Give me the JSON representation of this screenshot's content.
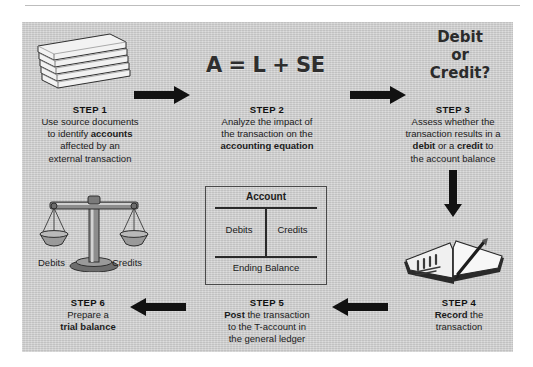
{
  "figure": {
    "panel_color": "#cccccc",
    "ink_color": "#1b1b1b"
  },
  "equation": {
    "text": "A = L + SE",
    "label": "accounting-equation"
  },
  "debit_or_credit": {
    "line1": "Debit",
    "line2": "or",
    "line3": "Credit?"
  },
  "t_account": {
    "header": "Account",
    "left_label": "Debits",
    "right_label": "Credits",
    "footer": "Ending Balance"
  },
  "scales": {
    "left_label": "Debits",
    "right_label": "Credits"
  },
  "steps": [
    {
      "id": "step-1",
      "title": "STEP 1",
      "lines": [
        [
          {
            "t": "Use source documents",
            "b": false
          }
        ],
        [
          {
            "t": "to identify ",
            "b": false
          },
          {
            "t": "accounts",
            "b": true
          }
        ],
        [
          {
            "t": "affected by an",
            "b": false
          }
        ],
        [
          {
            "t": "external transaction",
            "b": false
          }
        ]
      ]
    },
    {
      "id": "step-2",
      "title": "STEP 2",
      "lines": [
        [
          {
            "t": "Analyze the impact of",
            "b": false
          }
        ],
        [
          {
            "t": "the transaction on the",
            "b": false
          }
        ],
        [
          {
            "t": "accounting equation",
            "b": true
          }
        ]
      ]
    },
    {
      "id": "step-3",
      "title": "STEP 3",
      "lines": [
        [
          {
            "t": "Assess whether the",
            "b": false
          }
        ],
        [
          {
            "t": "transaction results in a",
            "b": false
          }
        ],
        [
          {
            "t": "debit",
            "b": true
          },
          {
            "t": " or a ",
            "b": false
          },
          {
            "t": "credit",
            "b": true
          },
          {
            "t": " to",
            "b": false
          }
        ],
        [
          {
            "t": "the account balance",
            "b": false
          }
        ]
      ]
    },
    {
      "id": "step-4",
      "title": "STEP 4",
      "lines": [
        [
          {
            "t": "Record",
            "b": true
          },
          {
            "t": " the",
            "b": false
          }
        ],
        [
          {
            "t": "transaction",
            "b": false
          }
        ]
      ]
    },
    {
      "id": "step-5",
      "title": "STEP 5",
      "lines": [
        [
          {
            "t": "Post",
            "b": true
          },
          {
            "t": " the transaction",
            "b": false
          }
        ],
        [
          {
            "t": "to the T-account in",
            "b": false
          }
        ],
        [
          {
            "t": "the general ledger",
            "b": false
          }
        ]
      ]
    },
    {
      "id": "step-6",
      "title": "STEP 6",
      "lines": [
        [
          {
            "t": "Prepare a",
            "b": false
          }
        ],
        [
          {
            "t": "trial balance",
            "b": true
          }
        ]
      ]
    }
  ],
  "arrows": [
    {
      "name": "arrow-step1-to-step2",
      "direction": "right"
    },
    {
      "name": "arrow-step2-to-step3",
      "direction": "right"
    },
    {
      "name": "arrow-step3-to-step4",
      "direction": "down"
    },
    {
      "name": "arrow-step4-to-step5",
      "direction": "left"
    },
    {
      "name": "arrow-step5-to-step6",
      "direction": "left"
    }
  ],
  "illustrations": [
    {
      "name": "document-stack-illustration",
      "step": "step-1"
    },
    {
      "name": "balance-scales-illustration",
      "step": "step-6"
    },
    {
      "name": "open-book-with-pen-illustration",
      "step": "step-4"
    }
  ]
}
